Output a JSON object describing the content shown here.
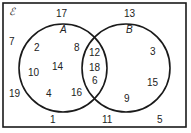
{
  "diagram": {
    "universal_symbol": "ℰ",
    "sets": [
      {
        "label": "A"
      },
      {
        "label": "B"
      }
    ],
    "regions": {
      "outside": [
        "17",
        "7",
        "13",
        "19",
        "1",
        "11",
        "5"
      ],
      "a_only": [
        "2",
        "8",
        "10",
        "14",
        "4",
        "16"
      ],
      "a_and_b": [
        "12",
        "18",
        "6"
      ],
      "b_only": [
        "3",
        "15",
        "9"
      ]
    },
    "colors": {
      "line": "#1a1a1a",
      "background": "#ffffff"
    }
  }
}
